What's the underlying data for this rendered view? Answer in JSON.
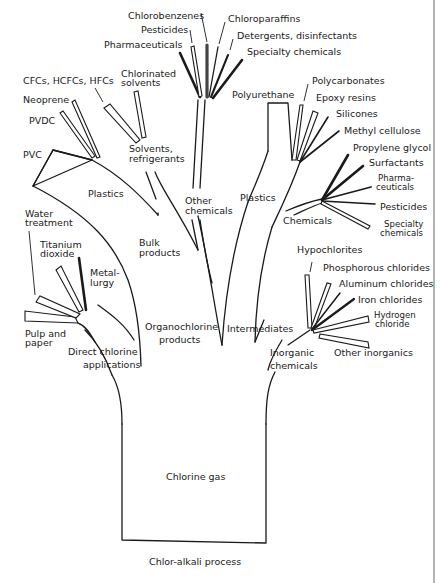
{
  "diagram": {
    "title": "Chlor-alkali process",
    "root": "Chlorine gas",
    "branches": {
      "direct": {
        "label_line1": "Direct chlorine",
        "label_line2": "applications",
        "leaves": {
          "water_1": "Water",
          "water_2": "treatment",
          "titanium_1": "Titanium",
          "titanium_2": "dioxide",
          "metal_1": "Metal-",
          "metal_2": "lurgy",
          "pulp_1": "Pulp and",
          "pulp_2": "paper"
        }
      },
      "organochlorine": {
        "label_line1": "Organochlorine",
        "label_line2": "products",
        "bulk_1": "Bulk",
        "bulk_2": "products",
        "plastics": {
          "label": "Plastics",
          "leaves": {
            "pvc": "PVC",
            "pvdc": "PVDC",
            "neoprene": "Neoprene",
            "cfcs": "CFCs, HCFCs, HFCs"
          }
        },
        "solvents": {
          "label_line1": "Solvents,",
          "label_line2": "refrigerants",
          "leaves": {
            "chlorinated_1": "Chlorinated",
            "chlorinated_2": "solvents"
          }
        },
        "other": {
          "label_line1": "Other",
          "label_line2": "chemicals",
          "leaves": {
            "chlorobenzenes": "Chlorobenzenes",
            "pesticides": "Pesticides",
            "pharmaceuticals": "Pharmaceuticals",
            "chloroparaffins": "Chloroparaffins",
            "detergents": "Detergents, disinfectants",
            "specialty": "Specialty chemicals"
          }
        }
      },
      "intermediates": {
        "label": "Intermediates",
        "plastics": {
          "label": "Plastics",
          "leaves": {
            "polyurethane": "Polyurethane",
            "polycarbonates": "Polycarbonates",
            "epoxy": "Epoxy resins",
            "silicones": "Silicones",
            "methyl": "Methyl cellulose"
          }
        },
        "chemicals": {
          "label": "Chemicals",
          "leaves": {
            "propylene": "Propylene glycol",
            "surfactants": "Surfactants",
            "pharma_1": "Pharma-",
            "pharma_2": "ceuticals",
            "pesticides": "Pesticides",
            "specialty_1": "Specialty",
            "specialty_2": "chemicals"
          }
        }
      },
      "inorganic": {
        "label_line1": "Inorganic",
        "label_line2": "chemicals",
        "leaves": {
          "hypochlorites": "Hypochlorites",
          "phosphorous": "Phosphorous chlorides",
          "aluminum": "Aluminum chlorides",
          "iron": "Iron chlorides",
          "hydrogen_1": "Hydrogen",
          "hydrogen_2": "chloride",
          "other": "Other inorganics"
        }
      }
    }
  }
}
